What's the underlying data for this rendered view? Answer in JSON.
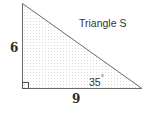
{
  "diagram": {
    "title": "Triangle S",
    "sides": {
      "left": {
        "label": "6"
      },
      "bottom": {
        "label": "9"
      }
    },
    "angle": {
      "value": "35",
      "unit": "°"
    },
    "right_angle_marker": true,
    "colors": {
      "stroke": "#555555",
      "fill_dots": "#d8d8d8",
      "text": "#333333"
    }
  }
}
